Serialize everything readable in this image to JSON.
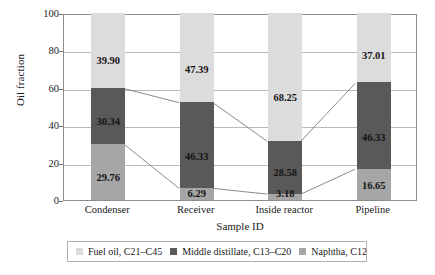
{
  "chart_data": {
    "type": "bar",
    "subtype": "stacked-bar-with-connectors",
    "title": "",
    "xlabel": "Sample ID",
    "ylabel": "Oil fraction",
    "categories": [
      "Condenser",
      "Receiver",
      "Inside reactor",
      "Pipeline"
    ],
    "ylim": [
      0,
      100
    ],
    "yticks": [
      0,
      20,
      40,
      60,
      80,
      100
    ],
    "ytick_labels": [
      "0",
      "20",
      "40",
      "60",
      "80",
      "100"
    ],
    "grid": true,
    "legend_position": "bottom",
    "series": [
      {
        "name": "Fuel oil, C21–C45",
        "color": "#dcdcdc",
        "values": [
          39.9,
          47.39,
          68.25,
          37.01
        ],
        "labels": [
          "39.90",
          "47.39",
          "68.25",
          "37.01"
        ]
      },
      {
        "name": "Middle distillate, C13–C20",
        "color": "#595959",
        "values": [
          30.34,
          46.33,
          28.58,
          46.33
        ],
        "labels": [
          "30.34",
          "46.33",
          "28.58",
          "46.33"
        ]
      },
      {
        "name": "Naphtha, C12–",
        "color": "#a6a6a6",
        "values": [
          29.76,
          6.29,
          3.18,
          16.65
        ],
        "labels": [
          "29.76",
          "6.29",
          "3.18",
          "16.65"
        ]
      }
    ],
    "stack_order_bottom_to_top": [
      "Naphtha, C12–",
      "Middle distillate, C13–C20",
      "Fuel oil, C21–C45"
    ]
  },
  "axes": {
    "y_title": "Oil fraction",
    "x_title": "Sample ID",
    "y_ticks": [
      "100",
      "80",
      "60",
      "40",
      "20",
      "0"
    ],
    "x_ticks": [
      "Condenser",
      "Receiver",
      "Inside reactor",
      "Pipeline"
    ]
  },
  "legend": {
    "items": [
      {
        "label": "Fuel oil, C21–C45",
        "color": "#dcdcdc"
      },
      {
        "label": "Middle distillate, C13–C20",
        "color": "#595959"
      },
      {
        "label": "Naphtha, C12–",
        "color": "#a6a6a6"
      }
    ]
  },
  "colors": {
    "fuel_oil": "#dcdcdc",
    "middle_distillate": "#595959",
    "naphtha": "#a6a6a6",
    "gridline": "#b9b9b9",
    "frame": "#8c8c8c",
    "connector": "#6b6b6b",
    "text": "#1a1a1a"
  }
}
